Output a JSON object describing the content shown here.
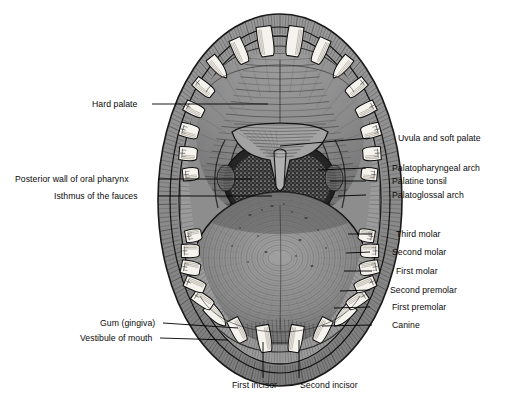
{
  "figure": {
    "domain": "anatomical-illustration",
    "style": "engraved pen-and-ink halftone, grayscale",
    "background_color": "#ffffff",
    "caption_fragment": ""
  },
  "palette": {
    "page": "#ffffff",
    "ink": "#111111",
    "lip_outer": "#8f8f8f",
    "lip_mid": "#a8a8a8",
    "mucosa": "#9b9b9b",
    "palate": "#8a8a8a",
    "tongue": "#8d8d8d",
    "tongue_shadow": "#6f6f6f",
    "pharynx_dark": "#2f2f2f",
    "tooth": "#f4f2ec",
    "tooth_shadow": "#cfcac0",
    "leader": "#000000"
  },
  "labels": {
    "left": [
      {
        "id": "hard-palate",
        "text": "Hard palate",
        "text_x": 92,
        "text_y": 99,
        "line": [
          [
            152,
            104
          ],
          [
            268,
            104
          ]
        ]
      },
      {
        "id": "posterior-wall-oral-pharynx",
        "text": "Posterior wall of oral pharynx",
        "text_x": 15,
        "text_y": 174,
        "line": [
          [
            158,
            179
          ],
          [
            252,
            179
          ]
        ]
      },
      {
        "id": "isthmus-of-fauces",
        "text": "Isthmus of the fauces",
        "text_x": 54,
        "text_y": 191,
        "line": [
          [
            158,
            196
          ],
          [
            272,
            196
          ]
        ]
      },
      {
        "id": "gum-gingiva",
        "text": "Gum (gingiva)",
        "text_x": 100,
        "text_y": 318,
        "line": [
          [
            163,
            323
          ],
          [
            238,
            328
          ]
        ]
      },
      {
        "id": "vestibule-of-mouth",
        "text": "Vestibule of mouth",
        "text_x": 80,
        "text_y": 333,
        "line": [
          [
            160,
            338
          ],
          [
            228,
            340
          ]
        ]
      }
    ],
    "right": [
      {
        "id": "uvula-and-soft-palate",
        "text": "Uvula and soft palate",
        "text_x": 398,
        "text_y": 133,
        "line": [
          [
            370,
            138
          ],
          [
            280,
            146
          ]
        ]
      },
      {
        "id": "palatopharyngeal-arch",
        "text": "Palatopharyngeal arch",
        "text_x": 392,
        "text_y": 163,
        "line": [
          [
            366,
            168
          ],
          [
            318,
            170
          ]
        ]
      },
      {
        "id": "palatine-tonsil",
        "text": "Palatine tonsil",
        "text_x": 392,
        "text_y": 176,
        "line": [
          [
            366,
            181
          ],
          [
            330,
            181
          ]
        ]
      },
      {
        "id": "palatoglossal-arch",
        "text": "Palatoglossal arch",
        "text_x": 392,
        "text_y": 190,
        "line": [
          [
            366,
            195
          ],
          [
            338,
            196
          ]
        ]
      },
      {
        "id": "third-molar",
        "text": "Third molar",
        "text_x": 396,
        "text_y": 229,
        "line": [
          [
            372,
            234
          ],
          [
            348,
            234
          ]
        ]
      },
      {
        "id": "second-molar",
        "text": "Second molar",
        "text_x": 392,
        "text_y": 247,
        "line": [
          [
            370,
            252
          ],
          [
            346,
            253
          ]
        ]
      },
      {
        "id": "first-molar",
        "text": "First molar",
        "text_x": 396,
        "text_y": 266,
        "line": [
          [
            372,
            271
          ],
          [
            344,
            271
          ]
        ]
      },
      {
        "id": "second-premolar",
        "text": "Second premolar",
        "text_x": 390,
        "text_y": 285,
        "line": [
          [
            370,
            290
          ],
          [
            340,
            291
          ]
        ]
      },
      {
        "id": "first-premolar",
        "text": "First premolar",
        "text_x": 392,
        "text_y": 302,
        "line": [
          [
            370,
            307
          ],
          [
            334,
            308
          ]
        ]
      },
      {
        "id": "canine",
        "text": "Canine",
        "text_x": 392,
        "text_y": 320,
        "line": [
          [
            372,
            325
          ],
          [
            322,
            326
          ]
        ]
      }
    ],
    "bottom": [
      {
        "id": "first-incisor",
        "text": "First incisor",
        "text_x": 232,
        "text_y": 380,
        "line": [
          [
            263,
            378
          ],
          [
            263,
            342
          ]
        ]
      },
      {
        "id": "second-incisor",
        "text": "Second incisor",
        "text_x": 300,
        "text_y": 380,
        "line": [
          [
            299,
            378
          ],
          [
            299,
            340
          ]
        ]
      }
    ]
  }
}
